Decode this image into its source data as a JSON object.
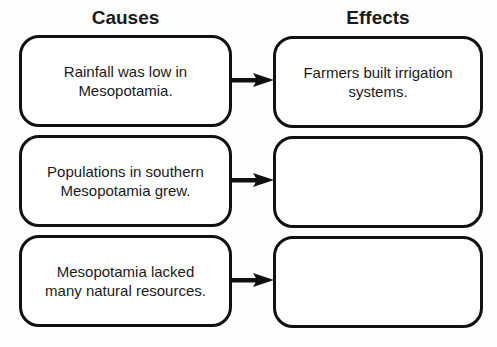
{
  "headings": {
    "causes": "Causes",
    "effects": "Effects"
  },
  "rows": [
    {
      "cause": "Rainfall was low in\nMesopotamia.",
      "effect": "Farmers built irrigation\nsystems."
    },
    {
      "cause": "Populations in southern\nMesopotamia grew.",
      "effect": ""
    },
    {
      "cause": "Mesopotamia lacked\nmany natural resources.",
      "effect": ""
    }
  ]
}
